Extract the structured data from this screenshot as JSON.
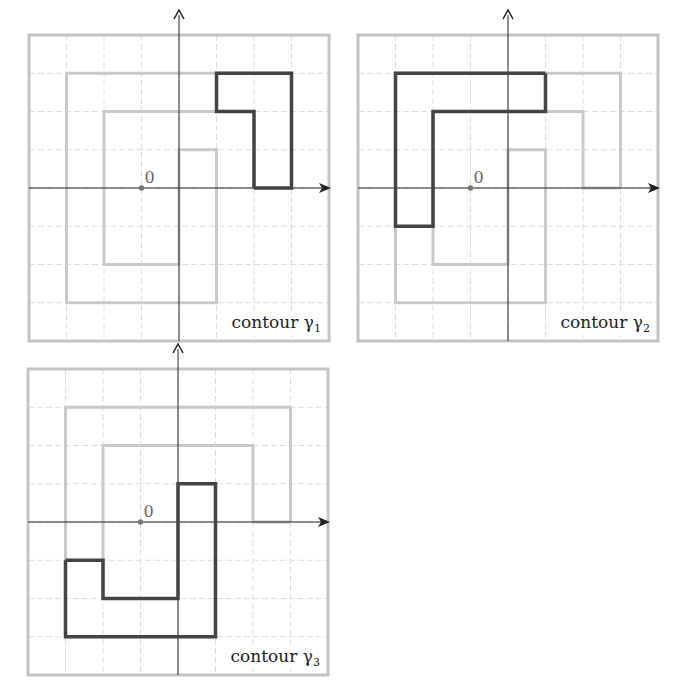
{
  "figure": {
    "grid": {
      "cols": 8,
      "rows": 8,
      "axis_col": 4,
      "axis_row": 4,
      "origin_col": 3,
      "origin_row": 4
    },
    "colors": {
      "contour": "#444444",
      "background_path": "#c9c9c9",
      "grid": "#dedede",
      "frame": "#c4c4c4",
      "axis": "#222222",
      "origin": "#777777"
    },
    "origin_label": "0",
    "full_path": [
      [
        7,
        4
      ],
      [
        7,
        1
      ],
      [
        1,
        1
      ],
      [
        1,
        7
      ],
      [
        5,
        7
      ],
      [
        5,
        3
      ],
      [
        4,
        3
      ],
      [
        4,
        6
      ],
      [
        2,
        6
      ],
      [
        2,
        2
      ],
      [
        6,
        2
      ],
      [
        6,
        4
      ],
      [
        7,
        4
      ]
    ],
    "panels": [
      {
        "id": "gamma1",
        "left": 29,
        "top": 35,
        "caption_prefix": "contour γ",
        "caption_sub": "1",
        "contour": [
          [
            6,
            4
          ],
          [
            7,
            4
          ],
          [
            7,
            1
          ],
          [
            5,
            1
          ],
          [
            5,
            2
          ],
          [
            6,
            2
          ],
          [
            6,
            4
          ]
        ]
      },
      {
        "id": "gamma2",
        "left": 358,
        "top": 35,
        "caption_prefix": "contour γ",
        "caption_sub": "2",
        "contour": [
          [
            5,
            1
          ],
          [
            1,
            1
          ],
          [
            1,
            5
          ],
          [
            2,
            5
          ],
          [
            2,
            2
          ],
          [
            5,
            2
          ],
          [
            5,
            1
          ]
        ]
      },
      {
        "id": "gamma3",
        "left": 28,
        "top": 369,
        "caption_prefix": "contour γ",
        "caption_sub": "3",
        "contour": [
          [
            1,
            5
          ],
          [
            1,
            7
          ],
          [
            5,
            7
          ],
          [
            5,
            3
          ],
          [
            4,
            3
          ],
          [
            4,
            6
          ],
          [
            2,
            6
          ],
          [
            2,
            5
          ],
          [
            1,
            5
          ]
        ]
      }
    ]
  }
}
